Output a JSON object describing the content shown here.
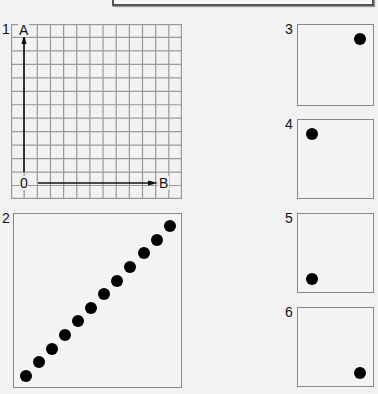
{
  "header": {
    "caption": ""
  },
  "panels": [
    {
      "number": "1",
      "type": "grid",
      "grid": {
        "columns": 13,
        "rows": 13
      },
      "axes": {
        "origin": "0",
        "vertical": "A",
        "horizontal": "B"
      }
    },
    {
      "number": "2",
      "type": "dots",
      "dot_count": 12,
      "description": "diagonal line of dots from bottom-left to top-right"
    },
    {
      "number": "3",
      "type": "dot",
      "position": "top-right"
    },
    {
      "number": "4",
      "type": "dot",
      "position": "top-left"
    },
    {
      "number": "5",
      "type": "dot",
      "position": "bottom-left"
    },
    {
      "number": "6",
      "type": "dot",
      "position": "bottom-right"
    }
  ],
  "colors": {
    "background": "#f2f2f2",
    "grid_line": "#999999",
    "dot": "#000000"
  }
}
